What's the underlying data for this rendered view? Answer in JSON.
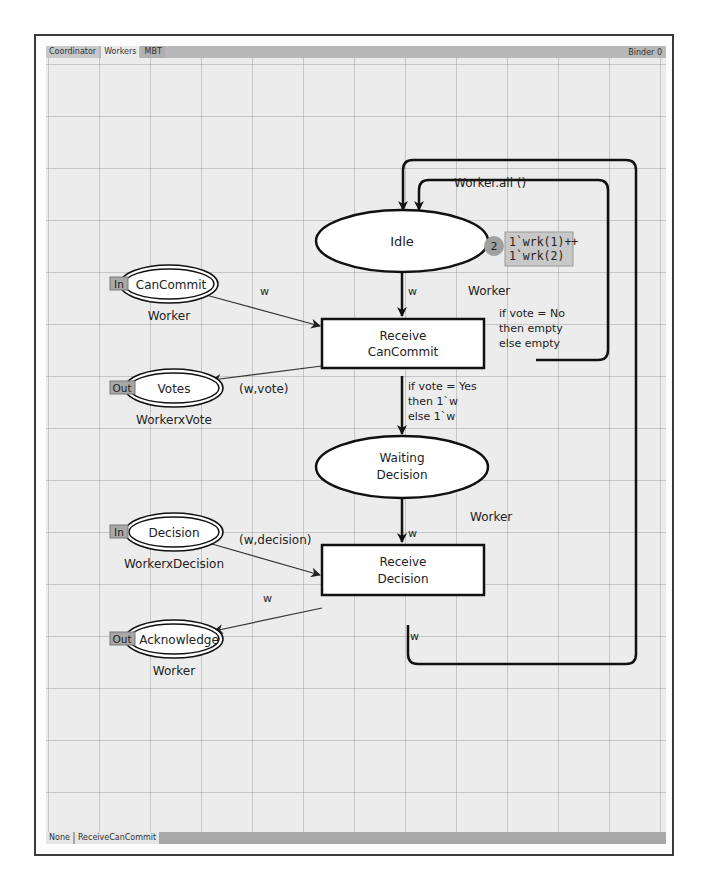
{
  "tabs": [
    {
      "label": "Coordinator",
      "active": false
    },
    {
      "label": "Workers",
      "active": true
    },
    {
      "label": "MBT",
      "active": false
    }
  ],
  "binder_label": "Binder 0",
  "status_bar": {
    "items": [
      "None",
      "ReceiveCanCommit"
    ]
  },
  "net": {
    "places": {
      "idle": {
        "name": "Idle",
        "type": "Worker",
        "token_count": "2",
        "marking": [
          "1`wrk(1)++",
          "1`wrk(2)"
        ],
        "initial_marking": "Worker.all ()"
      },
      "can_commit": {
        "name": "CanCommit",
        "type": "Worker",
        "port": "In"
      },
      "votes": {
        "name": "Votes",
        "type": "WorkerxVote",
        "port": "Out"
      },
      "waiting_decision": {
        "name_line1": "Waiting",
        "name_line2": "Decision",
        "type": "Worker"
      },
      "decision": {
        "name": "Decision",
        "type": "WorkerxDecision",
        "port": "In"
      },
      "acknowledge": {
        "name": "Acknowledge",
        "type": "Worker",
        "port": "Out"
      }
    },
    "transitions": {
      "receive_can_commit": {
        "line1": "Receive",
        "line2": "CanCommit"
      },
      "receive_decision": {
        "line1": "Receive",
        "line2": "Decision"
      }
    },
    "arcs": {
      "cancommit_to_rcc": "w",
      "idle_to_rcc": "w",
      "rcc_to_votes": "(w,vote)",
      "rcc_to_idle": [
        "if vote = No",
        "then empty",
        "else empty"
      ],
      "rcc_to_waiting": [
        "if vote = Yes",
        "then 1`w",
        "else 1`w"
      ],
      "waiting_to_rd": "w",
      "decision_to_rd": "(w,decision)",
      "rd_to_ack": "w",
      "rd_to_idle": "w"
    }
  },
  "colors": {
    "canvas_bg": "#ececec",
    "grid": "#a0a0a0",
    "tab_bar": "#b8b8b8",
    "port_tag": "#a8a8a8",
    "token_circle": "#a0a0a0",
    "marking_box": "#c8c8c8"
  }
}
